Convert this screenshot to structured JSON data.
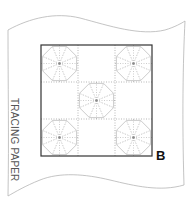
{
  "diagram": {
    "paper_label": "TRACING PAPER",
    "figure_letter": "B",
    "grid": {
      "rows": 3,
      "cols": 3
    },
    "motif_cells": [
      {
        "row": 0,
        "col": 0
      },
      {
        "row": 0,
        "col": 2
      },
      {
        "row": 1,
        "col": 1
      },
      {
        "row": 2,
        "col": 0
      },
      {
        "row": 2,
        "col": 2
      }
    ],
    "motif": "octagon-with-8-spokes",
    "colors": {
      "paper_outline": "#b5b5b5",
      "square_border": "#333333",
      "dotted_lines": "#9a9a9a",
      "motif_lines": "#a8a8a8"
    }
  }
}
